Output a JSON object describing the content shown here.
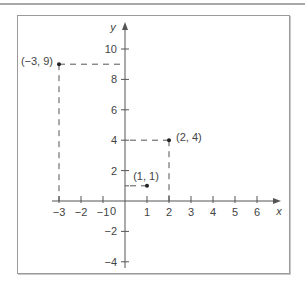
{
  "chart_data": {
    "type": "scatter",
    "title": "",
    "xlabel": "x",
    "ylabel": "y",
    "xlim": [
      -3,
      6
    ],
    "ylim": [
      -4,
      10
    ],
    "grid": false,
    "x_ticks": [
      -3,
      -2,
      -1,
      1,
      2,
      3,
      4,
      5,
      6
    ],
    "x_tick_labels": [
      "−3",
      "−2",
      "−1",
      "1",
      "2",
      "3",
      "4",
      "5",
      "6"
    ],
    "y_ticks": [
      -4,
      -2,
      2,
      4,
      6,
      8,
      10
    ],
    "y_tick_labels": [
      "−4",
      "−2",
      "2",
      "4",
      "6",
      "8",
      "10"
    ],
    "origin_label": "0",
    "points": [
      {
        "x": -3,
        "y": 9,
        "label": "(−3, 9)"
      },
      {
        "x": 2,
        "y": 4,
        "label": "(2, 4)"
      },
      {
        "x": 1,
        "y": 1,
        "label": "(1, 1)"
      }
    ],
    "series": [
      {
        "name": "points",
        "x": [
          -3,
          2,
          1
        ],
        "y": [
          9,
          4,
          1
        ]
      }
    ],
    "annotations": [
      "dashed guide lines from each point to the axes"
    ]
  },
  "colors": {
    "axis": "#555555",
    "point": "#222222",
    "dash": "#555555",
    "text": "#444444",
    "frame": "#9a9a9a"
  }
}
